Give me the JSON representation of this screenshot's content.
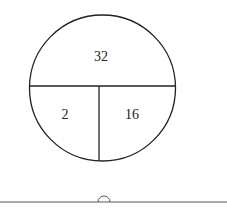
{
  "diagram": {
    "type": "divided-circle",
    "sections": [
      {
        "id": "top",
        "value": "32"
      },
      {
        "id": "bottom-left",
        "value": "2"
      },
      {
        "id": "bottom-right",
        "value": "16"
      }
    ],
    "stroke_color": "#222222",
    "baseline_color": "#555555"
  }
}
